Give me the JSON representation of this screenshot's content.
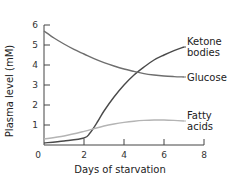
{
  "chart_data": {
    "type": "line",
    "title": "",
    "xlabel": "Days of starvation",
    "ylabel": "Plasma level (mM)",
    "xlim": [
      0,
      8
    ],
    "ylim": [
      0,
      6
    ],
    "xticks": [
      0,
      2,
      4,
      6,
      8
    ],
    "yticks": [
      0,
      1,
      2,
      3,
      4,
      5,
      6
    ],
    "grid": false,
    "legend": "inline-right",
    "series": [
      {
        "name": "Ketone bodies",
        "label_lines": [
          "Ketone",
          "bodies"
        ],
        "color": "#4a4a4a",
        "x": [
          0,
          1,
          2,
          2.3,
          2.7,
          3,
          3.5,
          4,
          4.5,
          5,
          5.5,
          6,
          6.5,
          7
        ],
        "y": [
          0.1,
          0.2,
          0.35,
          0.6,
          1.2,
          1.7,
          2.4,
          3.0,
          3.5,
          3.9,
          4.25,
          4.5,
          4.72,
          4.9
        ]
      },
      {
        "name": "Glucose",
        "label_lines": [
          "Glucose"
        ],
        "color": "#6e6e6e",
        "x": [
          0,
          0.5,
          1,
          1.5,
          2,
          2.5,
          3,
          3.5,
          4,
          4.5,
          5,
          5.5,
          6,
          6.5,
          7
        ],
        "y": [
          5.7,
          5.35,
          5.05,
          4.78,
          4.55,
          4.32,
          4.12,
          3.95,
          3.8,
          3.68,
          3.57,
          3.5,
          3.45,
          3.42,
          3.4
        ]
      },
      {
        "name": "Fatty acids",
        "label_lines": [
          "Fatty",
          "acids"
        ],
        "color": "#b4b4b4",
        "x": [
          0,
          1,
          2,
          2.5,
          3,
          3.5,
          4,
          4.5,
          5,
          5.5,
          6,
          6.5,
          7
        ],
        "y": [
          0.3,
          0.45,
          0.68,
          0.82,
          0.95,
          1.05,
          1.13,
          1.19,
          1.23,
          1.25,
          1.25,
          1.23,
          1.2
        ]
      }
    ]
  }
}
